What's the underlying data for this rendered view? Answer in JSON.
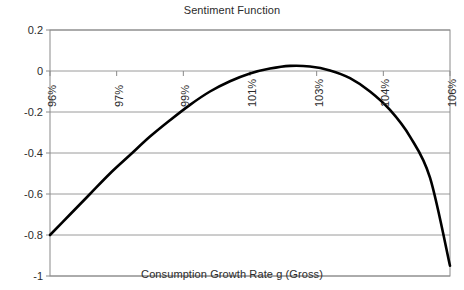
{
  "chart_data": {
    "type": "line",
    "title": "Sentiment Function",
    "xlabel": "Consumption Growth Rate g (Gross)",
    "ylabel": "",
    "grid": true,
    "legend": null,
    "legend_position": "none",
    "line_color": "#000000",
    "grid_color": "#9a9a9a",
    "axis_color": "#8a8a8a",
    "xlim": [
      96,
      106
    ],
    "ylim": [
      -1,
      0.2
    ],
    "xtick_labels": [
      "96%",
      "97%",
      "99%",
      "101%",
      "103%",
      "104%",
      "106%"
    ],
    "xtick_values": [
      96.0,
      97.0,
      99.0,
      101.0,
      103.0,
      104.0,
      106.0
    ],
    "xtick_positions_pct": [
      0,
      16.667,
      33.333,
      50,
      66.667,
      83.333,
      100
    ],
    "ytick_labels": [
      "0.2",
      "0",
      "-0.2",
      "-0.4",
      "-0.6",
      "-0.8",
      "-1"
    ],
    "ytick_values": [
      0.2,
      0,
      -0.2,
      -0.4,
      -0.6,
      -0.8,
      -1
    ],
    "x": [
      96.0,
      96.5,
      97.0,
      97.5,
      98.0,
      98.5,
      99.0,
      99.5,
      100.0,
      100.5,
      101.0,
      101.5,
      102.0,
      102.5,
      103.0,
      103.5,
      104.0,
      104.5,
      105.0,
      105.5,
      106.0
    ],
    "values": [
      -0.8,
      -0.7,
      -0.6,
      -0.5,
      -0.41,
      -0.32,
      -0.24,
      -0.165,
      -0.1,
      -0.05,
      -0.012,
      0.012,
      0.025,
      0.022,
      0.003,
      -0.035,
      -0.1,
      -0.19,
      -0.32,
      -0.52,
      -0.95
    ],
    "peak": {
      "x": 102.0,
      "y": 0.03
    },
    "endpoints": {
      "left": {
        "x": 96.0,
        "y": -0.8
      },
      "right": {
        "x": 106.0,
        "y": -0.95
      }
    }
  }
}
